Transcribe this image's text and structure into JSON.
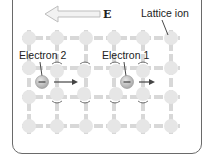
{
  "diagram": {
    "field": {
      "label": "E",
      "direction": "left"
    },
    "labels": {
      "lattice_ion": "Lattice ion",
      "electron_1": "Electron 1",
      "electron_2": "Electron 2"
    },
    "electron_symbol": "−",
    "lattice": {
      "columns": 6,
      "rows": 4
    },
    "colors": {
      "frame": "#6a6a6a",
      "ion": "#e3e3e3",
      "bond": "#d4d4d4",
      "electron": "#b8b8b8",
      "arrow": "#444444",
      "field_arrow_fill": "#f2f2f2",
      "field_arrow_stroke": "#bdbdbd"
    }
  }
}
